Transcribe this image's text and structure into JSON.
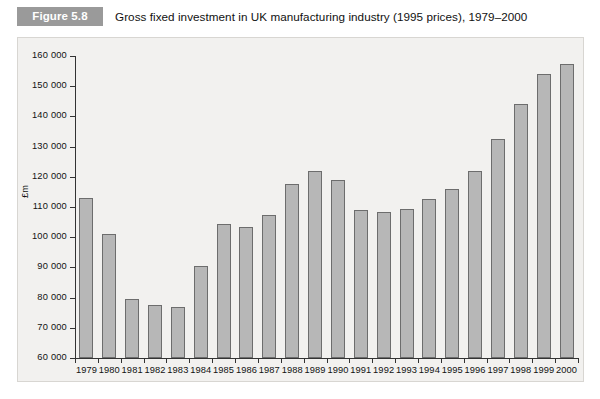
{
  "figure": {
    "tag": "Figure 5.8",
    "caption": "Gross fixed investment in UK manufacturing industry (1995 prices), 1979–2000"
  },
  "colors": {
    "tag_background": "#9a9a9a",
    "panel_background": "#f2f1ef",
    "bar_fill": "#b7b7b7",
    "bar_stroke": "#6d6d6d",
    "axis": "#333333",
    "text": "#111111"
  },
  "chart_data": {
    "type": "bar",
    "title": "Gross fixed investment in UK manufacturing industry (1995 prices), 1979–2000",
    "xlabel": "",
    "ylabel": "£m",
    "ylim": [
      60000,
      160000
    ],
    "ytick_step": 10000,
    "ytick_labels": [
      "160 000",
      "150 000",
      "140 000",
      "130 000",
      "120 000",
      "110 000",
      "100 000",
      "90 000",
      "80 000",
      "70 000",
      "60 000"
    ],
    "yticks": [
      160000,
      150000,
      140000,
      130000,
      120000,
      110000,
      100000,
      90000,
      80000,
      70000,
      60000
    ],
    "grid": false,
    "legend": null,
    "categories": [
      "1979",
      "1980",
      "1981",
      "1982",
      "1983",
      "1984",
      "1985",
      "1986",
      "1987",
      "1988",
      "1989",
      "1990",
      "1991",
      "1992",
      "1993",
      "1994",
      "1995",
      "1996",
      "1997",
      "1998",
      "1999",
      "2000"
    ],
    "values": [
      113000,
      101000,
      79500,
      77500,
      77000,
      90500,
      104500,
      103500,
      107500,
      117500,
      122000,
      119000,
      109000,
      108500,
      109500,
      112500,
      116000,
      122000,
      132500,
      144000,
      154000,
      157500
    ]
  }
}
